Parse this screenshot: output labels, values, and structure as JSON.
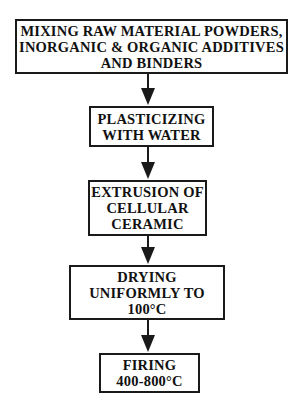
{
  "diagram": {
    "type": "flowchart",
    "direction": "top-to-bottom",
    "colors": {
      "stroke": "#1a1a1a",
      "text": "#111111",
      "background": "#ffffff"
    },
    "steps": [
      {
        "id": "mixing",
        "lines": [
          "MIXING RAW MATERIAL POWDERS,",
          "INORGANIC & ORGANIC ADDITIVES",
          "AND BINDERS"
        ]
      },
      {
        "id": "plasticizing",
        "lines": [
          "PLASTICIZING",
          "WITH WATER"
        ]
      },
      {
        "id": "extrusion",
        "lines": [
          "EXTRUSION OF",
          "CELLULAR",
          "CERAMIC"
        ]
      },
      {
        "id": "drying",
        "lines": [
          "DRYING",
          "UNIFORMLY TO",
          "100°C"
        ]
      },
      {
        "id": "firing",
        "lines": [
          "FIRING",
          "400-800°C"
        ]
      }
    ],
    "edges": [
      {
        "from": "mixing",
        "to": "plasticizing"
      },
      {
        "from": "plasticizing",
        "to": "extrusion"
      },
      {
        "from": "extrusion",
        "to": "drying"
      },
      {
        "from": "drying",
        "to": "firing"
      }
    ]
  }
}
